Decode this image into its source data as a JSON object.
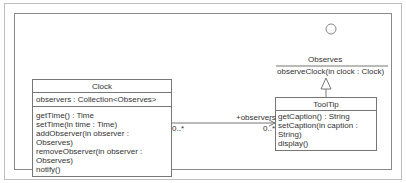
{
  "diagram": {
    "classes": {
      "clock": {
        "name": "Clock",
        "attributes": [
          "observers : Collection<Observes>"
        ],
        "operations": [
          "getTime() : Time",
          "setTime(in time : Time)",
          "addObserver(in observer : Observes)",
          "removeObserver(in observer : Observes)",
          "notify()"
        ]
      },
      "tooltip": {
        "name": "ToolTip",
        "operations": [
          "getCaption() : String",
          "setCaption(in caption : String)",
          "display()"
        ]
      }
    },
    "interface": {
      "name": "Observes",
      "operations": [
        "observeClock(in clock : Clock)"
      ]
    },
    "association": {
      "role": "+observers",
      "source_multiplicity": "0..*",
      "target_multiplicity": "0..*"
    }
  }
}
